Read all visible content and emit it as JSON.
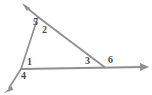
{
  "figure": {
    "background_color": "#ffffff",
    "line_color": "#8f8f8f",
    "label_color": "#4a4a4a",
    "stroke_width": 1.6,
    "canvas": {
      "width": 152,
      "height": 95
    }
  },
  "vertices": {
    "apex": {
      "name": "top-vertex",
      "x": 38,
      "y": 17
    },
    "left": {
      "name": "left-vertex",
      "x": 21,
      "y": 69
    },
    "right": {
      "name": "right-vertex",
      "x": 105,
      "y": 67
    }
  },
  "rays": [
    {
      "name": "transversal-ray",
      "from": {
        "x": 7,
        "y": 91
      },
      "to": {
        "x": 23,
        "y": 4
      },
      "arrow_at": "to",
      "description": "line through left vertex and apex, arrow pointing up-left"
    },
    {
      "name": "baseline-ray",
      "from": {
        "x": 5,
        "y": 92
      },
      "to": {
        "x": 148,
        "y": 67
      },
      "arrow_at": "to",
      "description": "horizontal base line, arrow pointing right"
    },
    {
      "name": "hypotenuse-segment",
      "from": {
        "x": 38,
        "y": 17
      },
      "to": {
        "x": 105,
        "y": 67
      },
      "arrow_at": "none",
      "description": "slanted side from apex down to right vertex"
    }
  ],
  "arrowheads": [
    {
      "name": "upper-left-arrowhead",
      "x": 23,
      "y": 4,
      "angle_deg": -100
    },
    {
      "name": "lower-left-arrowhead",
      "x": 5,
      "y": 92,
      "angle_deg": 100
    },
    {
      "name": "right-arrowhead",
      "x": 148,
      "y": 67,
      "angle_deg": 0
    }
  ],
  "angle_labels": [
    {
      "id": "label-1",
      "text": "1",
      "x": 27,
      "y": 58,
      "vertex": "left-vertex",
      "position": "interior above base"
    },
    {
      "id": "label-2",
      "text": "2",
      "x": 42,
      "y": 25,
      "vertex": "top-vertex",
      "position": "interior right of apex"
    },
    {
      "id": "label-3",
      "text": "3",
      "x": 85,
      "y": 57,
      "vertex": "right-vertex",
      "position": "interior left of right vertex"
    },
    {
      "id": "label-4",
      "text": "4",
      "x": 21,
      "y": 71,
      "vertex": "left-vertex",
      "position": "exterior below base"
    },
    {
      "id": "label-5",
      "text": "5",
      "x": 33,
      "y": 17,
      "vertex": "top-vertex",
      "position": "exterior left of apex"
    },
    {
      "id": "label-6",
      "text": "6",
      "x": 108,
      "y": 56,
      "vertex": "right-vertex",
      "position": "exterior right of right vertex"
    }
  ]
}
